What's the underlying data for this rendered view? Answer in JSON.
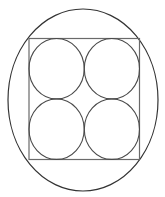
{
  "diagram": {
    "title": "",
    "colors": {
      "background": "#ffffff",
      "ellipse_stroke": "#333333",
      "square_stroke": "#6a6a6a",
      "circle_stroke": "#4a4a4a"
    },
    "ellipse": {
      "cx": 83,
      "cy": 100,
      "rx": 75,
      "ry": 91
    },
    "square": {
      "x": 29,
      "y": 38.5,
      "width": 110.5,
      "height": 121
    },
    "circles": [
      {
        "name": "top-left",
        "cx": 56.6,
        "cy": 68.7,
        "rx": 27.6,
        "ry": 30.2
      },
      {
        "name": "top-right",
        "cx": 111.9,
        "cy": 68.7,
        "rx": 27.6,
        "ry": 30.2
      },
      {
        "name": "bottom-left",
        "cx": 56.6,
        "cy": 129.2,
        "rx": 27.6,
        "ry": 30.2
      },
      {
        "name": "bottom-right",
        "cx": 111.9,
        "cy": 129.2,
        "rx": 27.6,
        "ry": 30.2
      }
    ]
  }
}
